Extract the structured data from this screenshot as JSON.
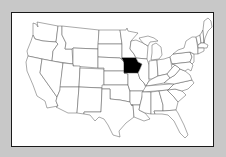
{
  "map": {
    "title": "United States map",
    "region": "Contiguous United States",
    "highlighted_state": "Iowa",
    "highlight_color": "#000000",
    "state_fill": "#ffffff",
    "state_stroke": "#555555",
    "background_color": "#c8c8c8",
    "frame_border_color": "#1a1a1a"
  }
}
